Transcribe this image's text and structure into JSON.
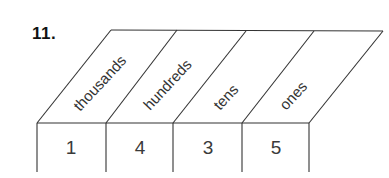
{
  "problem": {
    "number": "11."
  },
  "place_value_chart": {
    "columns": [
      {
        "label": "thousands",
        "digit": "1"
      },
      {
        "label": "hundreds",
        "digit": "4"
      },
      {
        "label": "tens",
        "digit": "3"
      },
      {
        "label": "ones",
        "digit": "5"
      }
    ]
  },
  "colors": {
    "line": "#333333",
    "text": "#333333",
    "background": "#ffffff"
  }
}
